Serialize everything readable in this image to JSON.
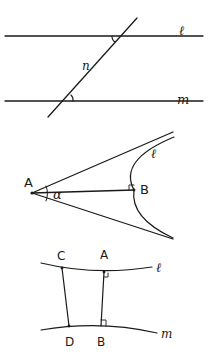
{
  "figures": [
    {
      "id": "parallel-lines-transversal",
      "labels": {
        "line_l": "ℓ",
        "line_m": "m",
        "transversal": "n"
      },
      "description": "Two parallel lines cut by a transversal with alternate angles marked"
    },
    {
      "id": "angle-of-parallelism",
      "labels": {
        "point_A": "A",
        "point_B": "B",
        "angle": "α",
        "curve": "ℓ"
      },
      "description": "Point A with perpendicular AB to curve ℓ; limiting parallel rays form angle α"
    },
    {
      "id": "saccheri-quadrilateral",
      "labels": {
        "point_C": "C",
        "point_A": "A",
        "point_D": "D",
        "point_B": "B",
        "curve_l": "ℓ",
        "curve_m": "m"
      },
      "description": "Curves ℓ and m with segments CD and AB, right angles at A and B"
    }
  ],
  "colors": {
    "ink": "#1a1a1a",
    "background": "#ffffff"
  }
}
